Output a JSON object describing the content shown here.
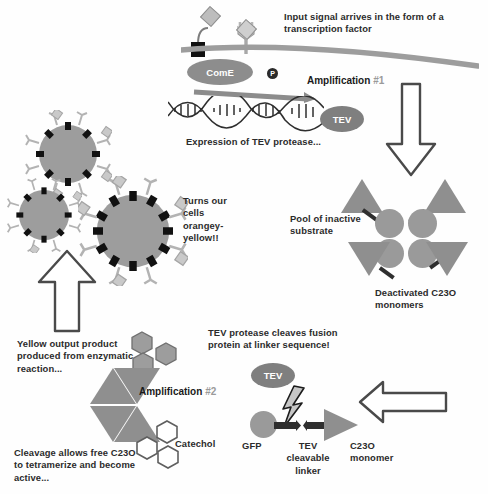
{
  "diagram": {
    "background": "#fefefe",
    "colors": {
      "gray_fill": "#8f8f8f",
      "light_gray": "#9d9d9d",
      "dark_outline": "#4a4a4a",
      "black": "#111111",
      "text": "#2b2b2b",
      "muted": "#9a9a9a"
    }
  },
  "labels": {
    "input_signal": "Input signal arrives in the form of a transcription factor",
    "amplification_1": "Amplification",
    "amplification_1_num": "#1",
    "expression": "Expression of TEV protease...",
    "pool_inactive": "Pool of inactive substrate",
    "deactivated": "Deactivated C23O monomers",
    "turns_cells": "Turns our cells orangey-yellow!!",
    "yellow_output": "Yellow output product produced from enzymatic reaction...",
    "amplification_2": "Amplification",
    "amplification_2_num": "#2",
    "cleavage": "Cleavage allows free C23O to tetramerize and become active...",
    "tev_cleaves": "TEV protease cleaves fusion protein at linker sequence!",
    "catechol": "Catechol",
    "gfp": "GFP",
    "tev_cleavable_linker": "TEV cleavable linker",
    "c23o_monomer": "C23O monomer"
  },
  "molecules": {
    "come": "ComE",
    "tev_top": "TEV",
    "tev_bottom": "TEV",
    "phosphate": "P"
  },
  "arrows": {
    "down_arrow": "down-arrow",
    "up_arrow": "up-arrow",
    "left_arrow": "left-arrow",
    "promoter_arrow": "promoter-arrow"
  }
}
